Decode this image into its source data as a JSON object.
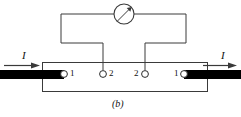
{
  "figure": {
    "caption": "(b)",
    "type": "electrical-circuit-schematic",
    "colors": {
      "line": "#3a3a3a",
      "electrode": "#000000",
      "terminal_fill": "#ffffff",
      "background": "#ffffff",
      "text": "#111111"
    },
    "meter": {
      "name": "galvanometer",
      "shape": "circle-with-needle",
      "cx": 124,
      "cy": 14,
      "r": 10,
      "needle_label": ""
    },
    "current_labels": {
      "left": "I",
      "right": "I"
    },
    "terminals": [
      {
        "id": "left-outer",
        "label": "1",
        "label_side": "right",
        "cx": 64,
        "cy": 74
      },
      {
        "id": "left-inner",
        "label": "2",
        "label_side": "right",
        "cx": 103,
        "cy": 74
      },
      {
        "id": "right-inner",
        "label": "2",
        "label_side": "left",
        "cx": 145,
        "cy": 74
      },
      {
        "id": "right-outer",
        "label": "1",
        "label_side": "left",
        "cx": 184,
        "cy": 74
      }
    ],
    "electrodes": [
      {
        "id": "left-electrode",
        "x": 0,
        "y": 70,
        "width": 64,
        "height": 9
      },
      {
        "id": "right-electrode",
        "x": 184,
        "y": 70,
        "width": 57,
        "height": 9
      }
    ],
    "sample_body": {
      "x": 42,
      "y": 62,
      "width": 166,
      "height": 30
    }
  }
}
